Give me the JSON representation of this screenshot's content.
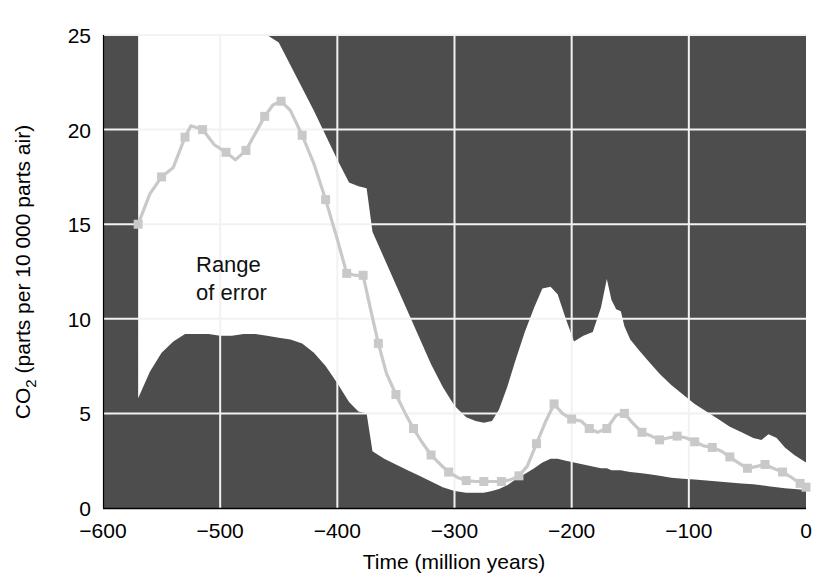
{
  "chart_data": {
    "type": "line",
    "title": "",
    "xlabel": "Time (million years)",
    "ylabel": "CO2 (parts per 10 000 parts air)",
    "ylabel_parts": {
      "prefix": "CO",
      "subscript": "2",
      "suffix": " (parts per 10 000 parts air)"
    },
    "xlim": [
      -600,
      0
    ],
    "ylim": [
      0,
      25
    ],
    "xticks": [
      -600,
      -500,
      -400,
      -300,
      -200,
      -100,
      0
    ],
    "xticklabels": [
      "−600",
      "−500",
      "−400",
      "−300",
      "−200",
      "−100",
      "0"
    ],
    "yticks": [
      0,
      5,
      10,
      15,
      20,
      25
    ],
    "yticklabels": [
      "0",
      "5",
      "10",
      "15",
      "20",
      "25"
    ],
    "grid": true,
    "grid_color": "#f2f2f2",
    "plot_background": "#4d4d4d",
    "band_fill": "#ffffff",
    "legend_position": "none",
    "annotations": [
      {
        "name": "range-of-error-label",
        "line1": "Range",
        "line2": "of error",
        "x": -505,
        "y": 12.6
      }
    ],
    "series": [
      {
        "name": "CO2 best estimate",
        "style": "line-with-square-markers",
        "color": "#c9c9c9",
        "marker": "square",
        "x": [
          -570,
          -560,
          -550,
          -540,
          -530,
          -525,
          -515,
          -505,
          -495,
          -487,
          -478,
          -470,
          -462,
          -455,
          -448,
          -440,
          -430,
          -420,
          -410,
          -400,
          -392,
          -385,
          -378,
          -372,
          -365,
          -358,
          -350,
          -342,
          -335,
          -328,
          -320,
          -312,
          -305,
          -297,
          -290,
          -282,
          -275,
          -268,
          -260,
          -252,
          -245,
          -238,
          -230,
          -222,
          -215,
          -208,
          -200,
          -192,
          -185,
          -178,
          -170,
          -162,
          -155,
          -148,
          -140,
          -132,
          -125,
          -118,
          -110,
          -102,
          -95,
          -88,
          -80,
          -72,
          -65,
          -58,
          -50,
          -42,
          -35,
          -28,
          -20,
          -12,
          -5,
          0
        ],
        "y": [
          15.0,
          16.6,
          17.5,
          18.0,
          19.6,
          20.2,
          20.0,
          19.2,
          18.8,
          18.4,
          18.9,
          19.8,
          20.7,
          21.3,
          21.5,
          21.0,
          19.7,
          18.2,
          16.3,
          14.2,
          12.4,
          12.3,
          12.3,
          10.6,
          8.7,
          7.1,
          6.0,
          5.0,
          4.2,
          3.5,
          2.8,
          2.3,
          1.9,
          1.6,
          1.45,
          1.4,
          1.4,
          1.4,
          1.4,
          1.5,
          1.7,
          2.2,
          3.4,
          4.6,
          5.5,
          5.0,
          4.7,
          4.6,
          4.2,
          4.0,
          4.2,
          4.9,
          5.0,
          4.5,
          4.0,
          3.8,
          3.6,
          3.7,
          3.8,
          3.7,
          3.5,
          3.3,
          3.2,
          3.0,
          2.7,
          2.4,
          2.1,
          2.2,
          2.3,
          2.1,
          1.9,
          1.6,
          1.3,
          1.1
        ]
      }
    ],
    "error_band": {
      "name": "Range of error",
      "x": [
        -570,
        -560,
        -550,
        -540,
        -530,
        -520,
        -510,
        -500,
        -490,
        -480,
        -470,
        -460,
        -450,
        -440,
        -430,
        -420,
        -410,
        -400,
        -390,
        -382,
        -375,
        -370,
        -360,
        -350,
        -340,
        -330,
        -320,
        -310,
        -300,
        -290,
        -282,
        -275,
        -268,
        -262,
        -255,
        -248,
        -240,
        -232,
        -225,
        -218,
        -212,
        -205,
        -198,
        -190,
        -182,
        -175,
        -170,
        -166,
        -162,
        -158,
        -155,
        -150,
        -142,
        -135,
        -125,
        -115,
        -105,
        -95,
        -85,
        -75,
        -65,
        -55,
        -45,
        -38,
        -32,
        -25,
        -18,
        -10,
        0
      ],
      "upper": [
        25.0,
        25.0,
        25.0,
        25.0,
        25.0,
        25.0,
        25.0,
        25.0,
        25.0,
        25.0,
        25.0,
        25.0,
        24.6,
        23.4,
        22.2,
        21.0,
        19.7,
        18.4,
        17.2,
        17.0,
        16.9,
        14.6,
        13.2,
        11.8,
        10.4,
        9.0,
        7.6,
        6.4,
        5.4,
        4.8,
        4.6,
        4.5,
        4.6,
        5.2,
        6.4,
        7.8,
        9.3,
        10.6,
        11.6,
        11.7,
        11.3,
        10.0,
        8.8,
        9.1,
        9.3,
        10.6,
        12.1,
        11.0,
        10.5,
        10.4,
        9.6,
        8.9,
        8.3,
        7.8,
        7.1,
        6.5,
        6.0,
        5.5,
        5.1,
        4.7,
        4.3,
        4.0,
        3.7,
        3.6,
        3.9,
        3.7,
        3.2,
        2.8,
        2.4
      ],
      "lower": [
        5.8,
        7.2,
        8.2,
        8.8,
        9.2,
        9.2,
        9.2,
        9.1,
        9.1,
        9.2,
        9.2,
        9.1,
        9.0,
        8.9,
        8.7,
        8.2,
        7.5,
        6.6,
        5.6,
        5.1,
        5.0,
        3.0,
        2.6,
        2.3,
        2.0,
        1.7,
        1.4,
        1.1,
        0.9,
        0.8,
        0.8,
        0.8,
        0.9,
        1.0,
        1.2,
        1.5,
        1.8,
        2.1,
        2.4,
        2.6,
        2.6,
        2.5,
        2.4,
        2.3,
        2.2,
        2.1,
        2.1,
        2.0,
        2.0,
        2.0,
        1.95,
        1.9,
        1.85,
        1.8,
        1.7,
        1.6,
        1.55,
        1.5,
        1.45,
        1.4,
        1.35,
        1.3,
        1.25,
        1.2,
        1.15,
        1.1,
        1.05,
        1.0,
        0.95
      ]
    }
  },
  "layout": {
    "plot_left": 103,
    "plot_right": 806,
    "plot_top": 35,
    "plot_bottom": 508
  }
}
